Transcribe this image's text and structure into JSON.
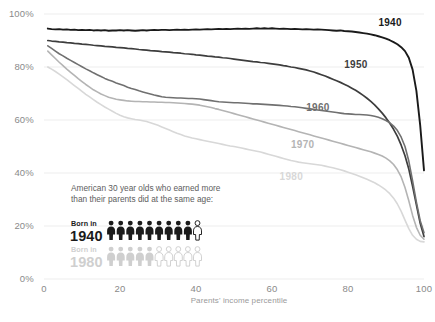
{
  "chart_data": {
    "type": "line",
    "title": "",
    "subtitle": "",
    "xlabel": "Parents' income percentile",
    "ylabel": "",
    "xlim": [
      0,
      100
    ],
    "ylim": [
      0,
      100
    ],
    "grid": true,
    "grid_axis": "y",
    "legend_position": "inline-right-end-labels",
    "x_ticks": [
      "0",
      "20",
      "40",
      "60",
      "80",
      "100"
    ],
    "x_tick_values": [
      0,
      20,
      40,
      60,
      80,
      100
    ],
    "y_ticks": [
      "0%",
      "20%",
      "40%",
      "60%",
      "80%",
      "100%"
    ],
    "y_tick_values": [
      0,
      20,
      40,
      60,
      80,
      100
    ],
    "x": [
      1,
      2,
      3,
      4,
      5,
      6,
      7,
      8,
      9,
      10,
      11,
      12,
      13,
      14,
      15,
      16,
      17,
      18,
      19,
      20,
      21,
      22,
      23,
      24,
      25,
      26,
      27,
      28,
      29,
      30,
      31,
      32,
      33,
      34,
      35,
      36,
      37,
      38,
      39,
      40,
      41,
      42,
      43,
      44,
      45,
      46,
      47,
      48,
      49,
      50,
      51,
      52,
      53,
      54,
      55,
      56,
      57,
      58,
      59,
      60,
      61,
      62,
      63,
      64,
      65,
      66,
      67,
      68,
      69,
      70,
      71,
      72,
      73,
      74,
      75,
      76,
      77,
      78,
      79,
      80,
      81,
      82,
      83,
      84,
      85,
      86,
      87,
      88,
      89,
      90,
      91,
      92,
      93,
      94,
      95,
      96,
      97,
      98,
      99,
      100
    ],
    "series": [
      {
        "name": "1940",
        "label": "1940",
        "color": "#1a1a1a",
        "width": 1.9,
        "label_x": 88,
        "label_y": 95.5,
        "values": [
          94.5,
          94.3,
          94.2,
          94.3,
          94.1,
          94.2,
          94.0,
          94.1,
          93.9,
          94.0,
          93.9,
          94.0,
          93.8,
          93.9,
          93.8,
          93.9,
          93.7,
          93.8,
          93.8,
          93.9,
          93.8,
          93.9,
          93.8,
          93.7,
          93.8,
          93.9,
          93.8,
          93.9,
          94.0,
          93.9,
          94.0,
          94.0,
          93.9,
          94.0,
          94.1,
          94.0,
          94.1,
          94.0,
          94.1,
          94.2,
          94.1,
          94.2,
          94.3,
          94.2,
          94.3,
          94.4,
          94.3,
          94.4,
          94.3,
          94.4,
          94.5,
          94.4,
          94.5,
          94.4,
          94.5,
          94.6,
          94.5,
          94.6,
          94.5,
          94.6,
          94.5,
          94.4,
          94.5,
          94.4,
          94.3,
          94.4,
          94.3,
          94.2,
          94.3,
          94.2,
          94.1,
          94.2,
          94.1,
          94.0,
          93.9,
          93.8,
          93.7,
          93.8,
          93.6,
          93.5,
          93.4,
          93.2,
          93.0,
          92.8,
          92.6,
          92.3,
          92.0,
          91.6,
          91.2,
          90.7,
          90.1,
          89.4,
          88.6,
          87.5,
          86.0,
          83.5,
          79.0,
          71.0,
          58.0,
          41.0
        ]
      },
      {
        "name": "1950",
        "label": "1950",
        "color": "#3d3d3d",
        "width": 1.7,
        "label_x": 79,
        "label_y": 79.5,
        "values": [
          90.0,
          89.8,
          89.7,
          89.5,
          89.4,
          89.2,
          89.1,
          88.9,
          88.8,
          88.6,
          88.5,
          88.4,
          88.2,
          88.1,
          88.0,
          87.8,
          87.7,
          87.6,
          87.4,
          87.3,
          87.2,
          87.0,
          86.9,
          86.8,
          86.6,
          86.5,
          86.4,
          86.2,
          86.1,
          86.0,
          85.8,
          85.7,
          85.6,
          85.4,
          85.3,
          85.2,
          85.0,
          84.9,
          84.8,
          84.6,
          84.5,
          84.3,
          84.1,
          84.0,
          83.8,
          83.7,
          83.5,
          83.4,
          83.2,
          83.0,
          82.8,
          82.6,
          82.4,
          82.2,
          82.0,
          81.9,
          81.7,
          81.6,
          81.4,
          81.2,
          81.0,
          80.8,
          80.5,
          80.3,
          80.0,
          79.8,
          79.5,
          79.2,
          78.9,
          78.5,
          78.1,
          77.6,
          77.1,
          76.6,
          76.0,
          75.4,
          74.8,
          74.2,
          73.5,
          72.8,
          72.0,
          71.2,
          70.3,
          69.3,
          68.2,
          67.0,
          65.7,
          64.2,
          62.6,
          60.8,
          58.8,
          56.5,
          53.8,
          50.5,
          46.5,
          41.5,
          35.0,
          28.0,
          21.0,
          16.0
        ]
      },
      {
        "name": "1960",
        "label": "1960",
        "color": "#707070",
        "width": 1.6,
        "label_x": 69,
        "label_y": 63.5,
        "values": [
          88.0,
          87.0,
          86.0,
          85.0,
          84.2,
          83.3,
          82.5,
          81.7,
          80.9,
          80.1,
          79.3,
          78.6,
          77.8,
          77.1,
          76.4,
          75.7,
          75.1,
          74.6,
          74.0,
          73.5,
          73.0,
          72.4,
          71.9,
          71.5,
          71.0,
          70.6,
          70.2,
          69.8,
          69.4,
          69.1,
          68.8,
          68.6,
          68.5,
          68.4,
          68.3,
          68.3,
          68.2,
          68.1,
          68.1,
          68.0,
          67.9,
          67.7,
          67.5,
          67.3,
          67.1,
          66.9,
          66.8,
          66.7,
          66.6,
          66.5,
          66.5,
          66.4,
          66.3,
          66.2,
          66.1,
          66.1,
          66.0,
          65.9,
          65.8,
          65.7,
          65.6,
          65.5,
          65.4,
          65.3,
          65.1,
          65.0,
          64.8,
          64.6,
          64.4,
          64.2,
          64.0,
          63.8,
          63.6,
          63.4,
          63.2,
          63.0,
          62.8,
          62.6,
          62.4,
          62.3,
          62.2,
          62.1,
          62.1,
          62.0,
          61.9,
          61.7,
          61.4,
          61.0,
          60.5,
          59.8,
          58.9,
          57.7,
          56.0,
          53.5,
          50.0,
          44.5,
          37.0,
          29.0,
          22.0,
          17.5
        ]
      },
      {
        "name": "1970",
        "label": "1970",
        "color": "#b4b4b4",
        "width": 1.6,
        "label_x": 65,
        "label_y": 49.5,
        "values": [
          86.0,
          84.6,
          83.2,
          81.8,
          80.5,
          79.2,
          78.0,
          76.8,
          75.6,
          74.5,
          73.4,
          72.4,
          71.4,
          70.6,
          69.8,
          69.2,
          68.6,
          68.2,
          67.8,
          67.6,
          67.4,
          67.2,
          67.1,
          67.0,
          67.0,
          66.9,
          66.9,
          66.8,
          66.8,
          66.7,
          66.7,
          66.6,
          66.6,
          66.5,
          66.4,
          66.3,
          66.2,
          66.1,
          66.0,
          65.8,
          65.6,
          65.3,
          65.0,
          64.7,
          64.3,
          64.0,
          63.6,
          63.2,
          62.8,
          62.4,
          62.0,
          61.6,
          61.2,
          60.8,
          60.4,
          60.0,
          59.6,
          59.2,
          58.8,
          58.4,
          58.0,
          57.6,
          57.2,
          56.8,
          56.4,
          56.0,
          55.6,
          55.2,
          54.8,
          54.4,
          54.0,
          53.6,
          53.2,
          52.8,
          52.4,
          52.0,
          51.6,
          51.2,
          50.8,
          50.4,
          50.0,
          49.6,
          49.2,
          48.8,
          48.4,
          48.0,
          47.5,
          47.0,
          46.4,
          45.6,
          44.6,
          43.2,
          41.2,
          38.5,
          34.5,
          29.5,
          24.0,
          19.5,
          16.5,
          15.0
        ]
      },
      {
        "name": "1980",
        "label": "1980",
        "color": "#d8d8d8",
        "width": 1.6,
        "label_x": 62,
        "label_y": 37.5,
        "values": [
          80.0,
          79.2,
          78.3,
          77.3,
          76.3,
          75.2,
          74.1,
          73.0,
          71.9,
          70.8,
          69.7,
          68.7,
          67.7,
          66.7,
          65.8,
          64.9,
          64.1,
          63.3,
          62.5,
          61.8,
          61.2,
          60.8,
          60.5,
          60.2,
          60.0,
          59.7,
          59.4,
          59.0,
          58.5,
          58.0,
          57.4,
          56.8,
          56.2,
          55.6,
          55.0,
          54.5,
          54.0,
          53.6,
          53.2,
          52.9,
          52.6,
          52.3,
          52.0,
          51.7,
          51.4,
          51.1,
          50.8,
          50.5,
          50.2,
          50.0,
          49.7,
          49.4,
          49.1,
          48.8,
          48.5,
          48.2,
          47.9,
          47.5,
          47.1,
          46.7,
          46.3,
          45.9,
          45.5,
          45.1,
          44.7,
          44.4,
          44.1,
          43.9,
          43.7,
          43.5,
          43.3,
          43.1,
          42.9,
          42.6,
          42.3,
          42.0,
          41.6,
          41.2,
          40.8,
          40.3,
          39.8,
          39.3,
          38.8,
          38.2,
          37.6,
          37.0,
          36.3,
          35.5,
          34.6,
          33.5,
          32.2,
          30.5,
          28.3,
          25.5,
          22.2,
          19.0,
          16.5,
          15.0,
          14.2,
          14.0
        ]
      }
    ],
    "annotation": {
      "text_line1": "American 30 year olds who earned more",
      "text_line2": "than their parents did at the same age:",
      "rows": [
        {
          "born_label": "Born in",
          "year": "1940",
          "filled": 9,
          "total": 10,
          "percent": "90%",
          "color": "#1a1a1a"
        },
        {
          "born_label": "Born in",
          "year": "1980",
          "filled": 5,
          "total": 10,
          "percent": "50%",
          "color": "#cfcfcf"
        }
      ]
    },
    "colors": {
      "background": "#ffffff",
      "gridline": "#ebebeb",
      "axis_text": "#8a8a8a",
      "annotation_text": "#5d5d5d"
    }
  }
}
